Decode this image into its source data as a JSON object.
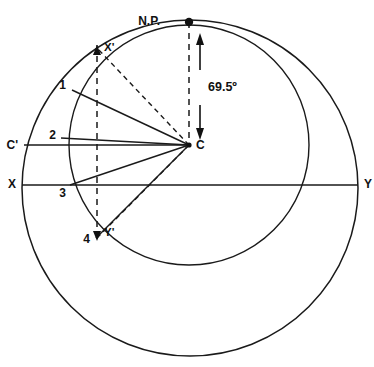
{
  "figure": {
    "type": "geometry-diagram",
    "background_color": "#ffffff",
    "line_color": "#1a1a1a"
  },
  "labels": {
    "north_pole": "N.P.",
    "x_prime": "X'",
    "c_prime": "C'",
    "x": "X",
    "y": "Y",
    "y_prime": "Y'",
    "center": "C",
    "point_1": "1",
    "point_2": "2",
    "point_3": "3",
    "point_4": "4",
    "angle": "69.5º"
  },
  "geometry": {
    "outer_circle": {
      "cx": 190,
      "cy": 188,
      "r": 168
    },
    "inner_circle": {
      "cx": 189,
      "cy": 145,
      "r": 120
    },
    "center_point": {
      "x": 189,
      "y": 145
    },
    "north_pole_point": {
      "x": 189,
      "y": 22
    },
    "axis_line_xy": {
      "x1": 22,
      "y1": 185,
      "x2": 358,
      "y2": 185
    },
    "axis_line_cc": {
      "x1": 24,
      "y1": 145,
      "x2": 189,
      "y2": 145
    },
    "vertical_dashed_left": {
      "x": 97,
      "y1": 48,
      "y2": 240
    },
    "vertical_dashed_center": {
      "x": 189,
      "y1": 22,
      "y2": 145
    },
    "radials": [
      {
        "label": "1",
        "x": 72,
        "y": 90
      },
      {
        "label": "2",
        "x": 61,
        "y": 138
      },
      {
        "label": "3",
        "x": 70,
        "y": 185
      },
      {
        "label": "4",
        "x": 96,
        "y": 238
      }
    ],
    "dashed_radials": [
      {
        "label": "X'",
        "x": 97,
        "y": 48
      },
      {
        "label": "Y'",
        "x": 97,
        "y": 238
      }
    ],
    "angle_arrow": {
      "x": 200,
      "y_top": 38,
      "y_bottom": 138
    }
  }
}
